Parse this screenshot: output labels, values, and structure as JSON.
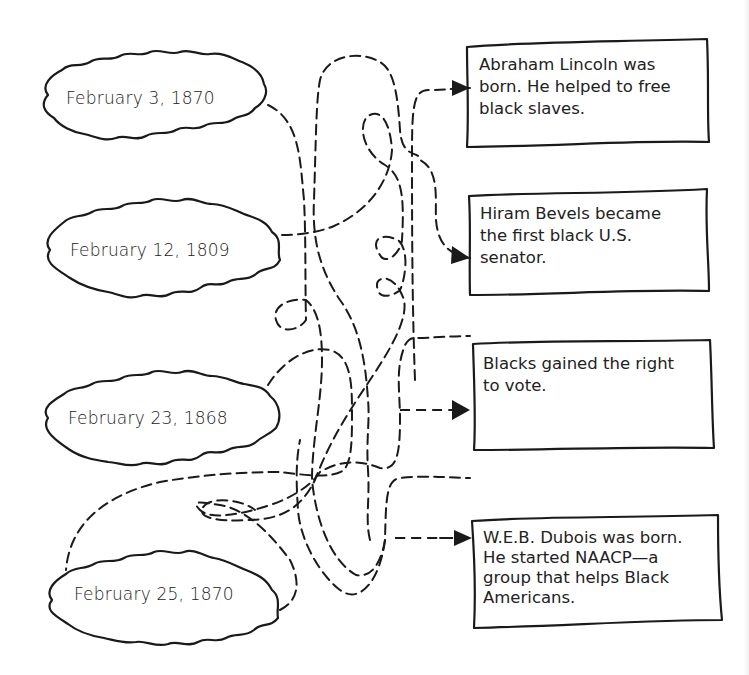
{
  "diagram": {
    "type": "matching-maze",
    "dates": [
      {
        "label": "February 3, 1870"
      },
      {
        "label": "February 12, 1809"
      },
      {
        "label": "February 23, 1868"
      },
      {
        "label": "February 25, 1870"
      }
    ],
    "events": [
      {
        "lines": [
          "Abraham Lincoln was",
          "born. He helped to free",
          "black slaves."
        ]
      },
      {
        "lines": [
          "Hiram Bevels became",
          "the first black U.S.",
          "senator."
        ]
      },
      {
        "lines": [
          "Blacks gained the right",
          "to vote."
        ]
      },
      {
        "lines": [
          "W.E.B. Dubois was born.",
          "He started NAACP—a",
          "group that helps Black",
          "Americans."
        ]
      }
    ],
    "colors": {
      "ink": "#1a1a1a",
      "background": "#ffffff"
    }
  }
}
